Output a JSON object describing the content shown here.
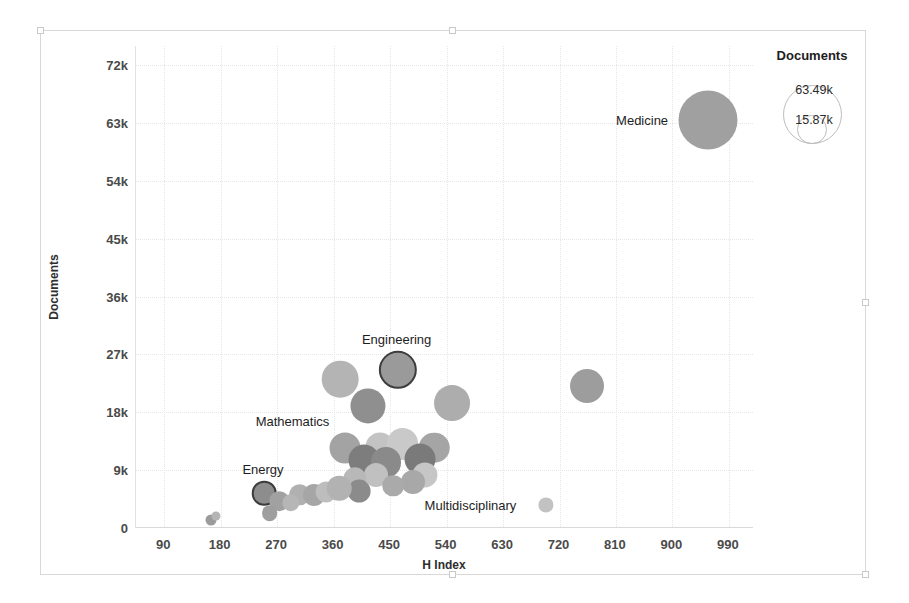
{
  "chart_data": {
    "type": "scatter",
    "title": "",
    "xlabel": "H Index",
    "ylabel": "Documents",
    "xlim": [
      45,
      1030
    ],
    "ylim": [
      0,
      75000
    ],
    "grid": true,
    "xticks": [
      "90",
      "180",
      "270",
      "360",
      "450",
      "540",
      "630",
      "720",
      "810",
      "900",
      "990"
    ],
    "xtick_values": [
      90,
      180,
      270,
      360,
      450,
      540,
      630,
      720,
      810,
      900,
      990
    ],
    "yticks": [
      "0",
      "9k",
      "18k",
      "27k",
      "36k",
      "45k",
      "54k",
      "63k",
      "72k"
    ],
    "ytick_values": [
      0,
      9000,
      18000,
      27000,
      36000,
      45000,
      54000,
      63000,
      72000
    ],
    "size_field": "Documents",
    "legend": {
      "position": "top-right",
      "title": "Documents",
      "entries": [
        {
          "label": "63.49k",
          "value": 63490
        },
        {
          "label": "15.87k",
          "value": 15870
        }
      ]
    },
    "points": [
      {
        "label": "Medicine",
        "x": 957,
        "y": 63490,
        "size": 63490,
        "shade": "#a0a0a0",
        "selected": false,
        "label_pos": "left"
      },
      {
        "label": "",
        "x": 764,
        "y": 22100,
        "size": 21000,
        "shade": "#9d9d9d",
        "selected": false
      },
      {
        "label": "Engineering",
        "x": 462,
        "y": 24600,
        "size": 26800,
        "shade": "#9a9a9a",
        "selected": true,
        "label_pos": "top"
      },
      {
        "label": "",
        "x": 370,
        "y": 23200,
        "size": 24500,
        "shade": "#b4b4b4",
        "selected": false
      },
      {
        "label": "",
        "x": 414,
        "y": 19000,
        "size": 22500,
        "shade": "#8f8f8f",
        "selected": false
      },
      {
        "label": "",
        "x": 549,
        "y": 19400,
        "size": 23500,
        "shade": "#adadad",
        "selected": false
      },
      {
        "label": "Mathematics",
        "x": 378,
        "y": 12400,
        "size": 17500,
        "shade": "#a3a3a3",
        "selected": false,
        "label_pos": "topleft"
      },
      {
        "label": "",
        "x": 434,
        "y": 12600,
        "size": 15500,
        "shade": "#c3c3c3",
        "selected": false
      },
      {
        "label": "",
        "x": 470,
        "y": 13000,
        "size": 18500,
        "shade": "#c9c9c9",
        "selected": false
      },
      {
        "label": "",
        "x": 520,
        "y": 12500,
        "size": 17000,
        "shade": "#a5a5a5",
        "selected": false
      },
      {
        "label": "",
        "x": 409,
        "y": 10600,
        "size": 17500,
        "shade": "#7d7d7d",
        "selected": false
      },
      {
        "label": "",
        "x": 443,
        "y": 10200,
        "size": 16500,
        "shade": "#8a8a8a",
        "selected": false
      },
      {
        "label": "",
        "x": 498,
        "y": 10700,
        "size": 17500,
        "shade": "#7a7a7a",
        "selected": false
      },
      {
        "label": "",
        "x": 428,
        "y": 8300,
        "size": 10500,
        "shade": "#c0c0c0",
        "selected": false
      },
      {
        "label": "",
        "x": 505,
        "y": 8200,
        "size": 11500,
        "shade": "#c6c6c6",
        "selected": false
      },
      {
        "label": "",
        "x": 394,
        "y": 7600,
        "size": 10000,
        "shade": "#b8b8b8",
        "selected": false
      },
      {
        "label": "",
        "x": 487,
        "y": 7200,
        "size": 10500,
        "shade": "#a8a8a8",
        "selected": false
      },
      {
        "label": "",
        "x": 401,
        "y": 5700,
        "size": 9500,
        "shade": "#8b8b8b",
        "selected": false
      },
      {
        "label": "",
        "x": 455,
        "y": 6600,
        "size": 8500,
        "shade": "#aaaaaa",
        "selected": false
      },
      {
        "label": "",
        "x": 306,
        "y": 5200,
        "size": 8500,
        "shade": "#b0b0b0",
        "selected": false
      },
      {
        "label": "",
        "x": 329,
        "y": 5100,
        "size": 8800,
        "shade": "#a6a6a6",
        "selected": false
      },
      {
        "label": "",
        "x": 348,
        "y": 5600,
        "size": 8000,
        "shade": "#bdbdbd",
        "selected": false
      },
      {
        "label": "",
        "x": 369,
        "y": 6200,
        "size": 11000,
        "shade": "#b2b2b2",
        "selected": false
      },
      {
        "label": "Energy",
        "x": 249,
        "y": 5400,
        "size": 11000,
        "shade": "#8d8d8d",
        "selected": true,
        "label_pos": "top"
      },
      {
        "label": "",
        "x": 273,
        "y": 4200,
        "size": 7000,
        "shade": "#a1a1a1",
        "selected": false
      },
      {
        "label": "",
        "x": 292,
        "y": 3900,
        "size": 5500,
        "shade": "#b6b6b6",
        "selected": false
      },
      {
        "label": "",
        "x": 258,
        "y": 2300,
        "size": 4500,
        "shade": "#9e9e9e",
        "selected": false
      },
      {
        "label": "Multidisciplinary",
        "x": 698,
        "y": 3600,
        "size": 4200,
        "shade": "#c2c2c2",
        "selected": false,
        "label_pos": "left"
      },
      {
        "label": "",
        "x": 165,
        "y": 1200,
        "size": 2200,
        "shade": "#9b9b9b",
        "selected": false
      },
      {
        "label": "",
        "x": 172,
        "y": 1900,
        "size": 1500,
        "shade": "#b5b5b5",
        "selected": false
      }
    ]
  }
}
